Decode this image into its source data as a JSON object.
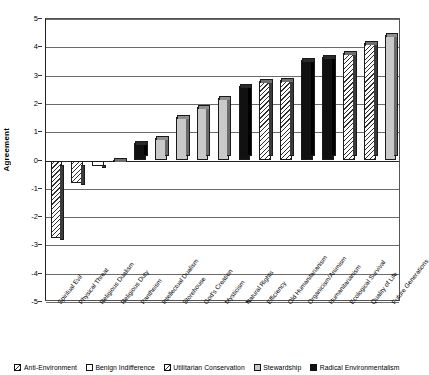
{
  "chart_data": {
    "type": "bar",
    "title": "",
    "xlabel": "",
    "ylabel": "Agreement",
    "ylim": [
      -5,
      5
    ],
    "yticks": [
      5,
      4,
      3,
      2,
      1,
      0,
      -1,
      -2,
      -3,
      -4,
      -5
    ],
    "grid": true,
    "legend_position": "bottom",
    "categories": [
      "Spiritual Evil",
      "Physical Threat",
      "Religious Dualism",
      "Religious Duty",
      "Pantheism",
      "Intellectual Dualism",
      "Storehouse",
      "God's Creation",
      "Mysticism",
      "Natural Rights",
      "Efficiency",
      "Old Humanitarianism",
      "Organicism/Animism",
      "Humanitarianism",
      "Ecological Survival",
      "Quality of Life",
      "Future Generations"
    ],
    "values": [
      -2.75,
      -0.8,
      -0.2,
      0.03,
      0.62,
      0.8,
      1.52,
      1.9,
      2.2,
      2.65,
      2.82,
      2.85,
      3.55,
      3.65,
      3.8,
      4.15,
      4.45
    ],
    "groups": [
      "Anti-Environment",
      "Anti-Environment",
      "Benign Indifference",
      "Benign Indifference",
      "Radical Environmentalism",
      "Stewardship",
      "Stewardship",
      "Stewardship",
      "Stewardship",
      "Radical Environmentalism",
      "Utilitarian Conservation",
      "Utilitarian Conservation",
      "Radical Environmentalism",
      "Radical Environmentalism",
      "Utilitarian Conservation",
      "Utilitarian Conservation",
      "Stewardship"
    ],
    "legend": [
      {
        "label": "Anti-Environment",
        "fill": "hatch"
      },
      {
        "label": "Benign Indifference",
        "fill": "white"
      },
      {
        "label": "Utilitarian Conservation",
        "fill": "hatch"
      },
      {
        "label": "Stewardship",
        "fill": "gray"
      },
      {
        "label": "Radical Environmentalism",
        "fill": "black"
      }
    ],
    "colors": {
      "hatch_line": "#303030",
      "white": "#ffffff",
      "gray": "#c9c9c9",
      "black": "#111111",
      "gridline": "#6b6b6b",
      "axis": "#222222"
    }
  }
}
